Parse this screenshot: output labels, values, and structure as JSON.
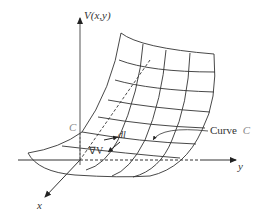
{
  "diagram": {
    "axes": {
      "vertical_label": "V(x,y)",
      "y_label": "y",
      "x_label": "x"
    },
    "labels": {
      "curve_point": "C",
      "curve_callout_text": "Curve",
      "curve_callout_name": "C",
      "dl": "dl",
      "gradient": "∇V"
    },
    "colors": {
      "stroke": "#333333",
      "label_gray": "#888888"
    }
  }
}
